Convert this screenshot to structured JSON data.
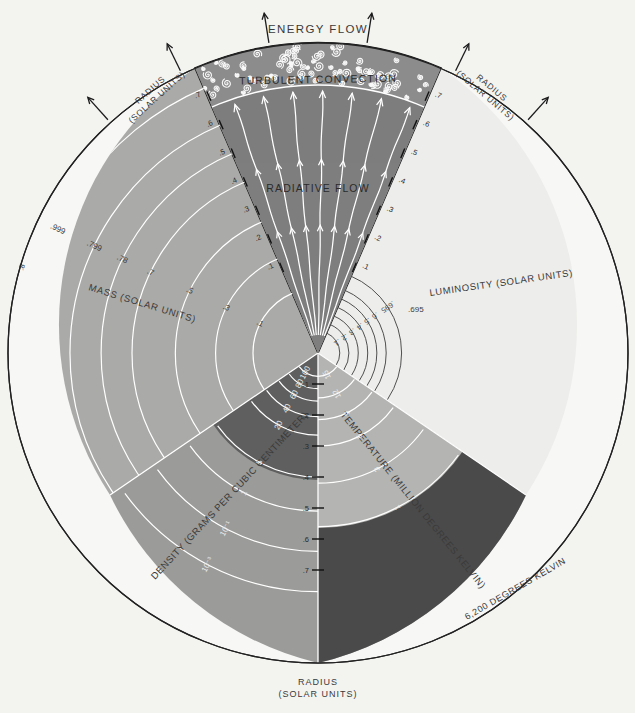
{
  "figure": {
    "center": {
      "x": 318,
      "y": 353
    },
    "radius_px": 310
  },
  "annotations": {
    "energy_flow": "ENERGY FLOW",
    "turbulent_convection": "TURBULENT CONVECTION",
    "radiative_flow": "RADIATIVE FLOW"
  },
  "axis_labels": {
    "radius_left": {
      "line1": "RADIUS",
      "line2": "(SOLAR UNITS)"
    },
    "radius_right": {
      "line1": "RADIUS",
      "line2": "(SOLAR UNITS)"
    },
    "radius_bottom": {
      "line1": "RADIUS",
      "line2": "(SOLAR UNITS)"
    },
    "mass": "MASS (SOLAR UNITS)",
    "luminosity": "LUMINOSITY (SOLAR UNITS)",
    "density": "DENSITY (GRAMS PER CUBIC CENTIMETER)",
    "temperature": "TEMPERATURE (MILLION DEGREES KELVIN)",
    "temperature_surface": "6,200 DEGREES KELVIN"
  },
  "colors": {
    "background": "#f3f3f0",
    "convection_band": "#8a8a8a",
    "radiative_wedge": "#7d7d7d",
    "mass_sector": "#a8a8a6",
    "luminosity_sector": "#ececea",
    "density_sector": "#9a9a98",
    "density_core": "#5d5d5d",
    "temperature_sector": "#b5b5b3",
    "temperature_outer": "#4a4a4a",
    "outline": "#222222",
    "arc_light": "#ffffff",
    "arc_dark": "#4a4a4a",
    "text": "#3a3a3a"
  },
  "chart_data": {
    "type": "pie",
    "xlabel": "Radius (solar units)",
    "ylabel": "",
    "sectors": [
      {
        "name": "convection zone band",
        "from_radius": 0.86,
        "to_radius": 1.0,
        "label": "TURBULENT CONVECTION"
      },
      {
        "name": "radiative zone wedge",
        "from_radius": 0.0,
        "to_radius": 0.86,
        "label": "RADIATIVE FLOW"
      },
      {
        "name": "mass",
        "label": "MASS (SOLAR UNITS)"
      },
      {
        "name": "luminosity",
        "label": "LUMINOSITY (SOLAR UNITS)"
      },
      {
        "name": "density",
        "label": "DENSITY (GRAMS PER CUBIC CENTIMETER)"
      },
      {
        "name": "temperature",
        "label": "TEMPERATURE (MILLION DEGREES KELVIN)"
      }
    ],
    "radius_ticks_left": [
      ".7",
      ".6",
      ".5",
      ".4",
      ".3",
      ".2",
      ".1"
    ],
    "radius_ticks_right": [
      ".7",
      ".6",
      ".5",
      ".4",
      ".3",
      ".2",
      ".1"
    ],
    "radius_ticks_bottom": [
      ".1",
      ".2",
      ".3",
      ".4",
      ".5",
      ".6",
      ".7"
    ],
    "radius_tick_outer_left": ".8",
    "mass_contours": [
      {
        "label": ".999",
        "r": 0.93
      },
      {
        "label": ".799",
        "r": 0.8
      },
      {
        "label": ".78",
        "r": 0.7
      },
      {
        "label": ".7",
        "r": 0.6
      },
      {
        "label": ".5",
        "r": 0.46
      },
      {
        "label": ".3",
        "r": 0.33
      },
      {
        "label": ".1",
        "r": 0.21
      }
    ],
    "luminosity_contours": [
      {
        "label": ".695",
        "r": 0.27
      },
      {
        "label": ".6",
        "r": 0.22
      },
      {
        "label": ".5",
        "r": 0.19
      },
      {
        "label": ".4",
        "r": 0.16
      },
      {
        "label": ".3",
        "r": 0.13
      },
      {
        "label": ".2",
        "r": 0.1
      },
      {
        "label": ".1",
        "r": 0.07
      }
    ],
    "density_contours": [
      {
        "label": "100",
        "r": 0.075
      },
      {
        "label": "80",
        "r": 0.115
      },
      {
        "label": "60",
        "r": 0.155
      },
      {
        "label": "40",
        "r": 0.205
      },
      {
        "label": "20",
        "r": 0.265
      },
      {
        "label": "5",
        "r": 0.4
      },
      {
        "label": "1",
        "r": 0.51
      },
      {
        "label": "10⁻¹",
        "r": 0.64
      },
      {
        "label": "10⁻³",
        "r": 0.77
      }
    ],
    "temperature_contours": [
      {
        "label": "15",
        "r": 0.075
      },
      {
        "label": "12",
        "r": 0.145
      },
      {
        "label": "9",
        "r": 0.215
      },
      {
        "label": "6",
        "r": 0.3
      },
      {
        "label": "3",
        "r": 0.42
      },
      {
        "label": "1",
        "r": 0.56
      },
      {
        "label": "6,200 DEGREES KELVIN",
        "r": 0.99
      }
    ],
    "units": {
      "radius": "solar units",
      "mass": "solar units",
      "luminosity": "solar units",
      "density": "grams per cubic centimeter",
      "temperature": "degrees Kelvin"
    }
  }
}
